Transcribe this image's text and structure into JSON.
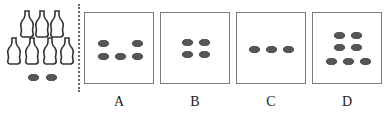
{
  "stimulus": {
    "bottles_top_row": 3,
    "bottles_bottom_row": 4,
    "bottle_count": 7,
    "oval_count": 2
  },
  "options": [
    {
      "label": "A",
      "dot_count": 5,
      "arrangement": "2 top (corners), 3 bottom"
    },
    {
      "label": "B",
      "dot_count": 4,
      "arrangement": "2x2 grid"
    },
    {
      "label": "C",
      "dot_count": 3,
      "arrangement": "single row"
    },
    {
      "label": "D",
      "dot_count": 7,
      "arrangement": "2, 2, 3 rows"
    }
  ],
  "colors": {
    "dot": "#555555",
    "border": "#7a7a7a",
    "bottle_outline": "#333333"
  }
}
